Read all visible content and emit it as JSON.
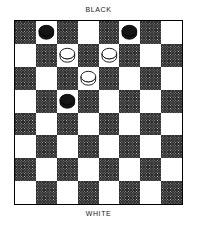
{
  "diagram": {
    "kind": "checkers-board-diagram",
    "top_label": "BLACK",
    "bottom_label": "WHITE"
  },
  "board": {
    "rows": 8,
    "cols": 8,
    "light_square_color": "#ffffff",
    "dark_square_color": "#2b2b2b",
    "border_color": "#000000",
    "top_left_square_shade": "dark"
  },
  "pieces": [
    {
      "color": "black",
      "row": 0,
      "col": 1,
      "type": "man"
    },
    {
      "color": "black",
      "row": 0,
      "col": 5,
      "type": "man"
    },
    {
      "color": "white",
      "row": 1,
      "col": 2,
      "type": "man"
    },
    {
      "color": "white",
      "row": 1,
      "col": 4,
      "type": "man"
    },
    {
      "color": "white",
      "row": 2,
      "col": 3,
      "type": "man"
    },
    {
      "color": "black",
      "row": 3,
      "col": 2,
      "type": "man"
    }
  ],
  "counts": {
    "black_pieces": 3,
    "white_pieces": 3
  }
}
